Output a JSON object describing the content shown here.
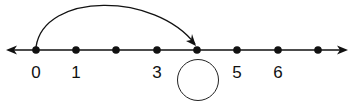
{
  "number_line": {
    "axis_y": 50,
    "x_start": 6,
    "x_end": 348,
    "arrows_both_ends": true,
    "color": "#111111",
    "points": [
      {
        "value": 0,
        "x": 36,
        "label": "0"
      },
      {
        "value": 1,
        "x": 76,
        "label": "1"
      },
      {
        "value": 2,
        "x": 116,
        "label": ""
      },
      {
        "value": 3,
        "x": 157,
        "label": "3"
      },
      {
        "value": 4,
        "x": 197,
        "label": ""
      },
      {
        "value": 5,
        "x": 237,
        "label": "5"
      },
      {
        "value": 6,
        "x": 278,
        "label": "6"
      },
      {
        "value": 7,
        "x": 318,
        "label": ""
      }
    ],
    "jump_arrow": {
      "from_value": 0,
      "to_value": 4,
      "peak_y": 10
    },
    "answer_blank": {
      "value_position": 4,
      "cx": 198,
      "cy": 80,
      "r": 21,
      "content": ""
    }
  }
}
